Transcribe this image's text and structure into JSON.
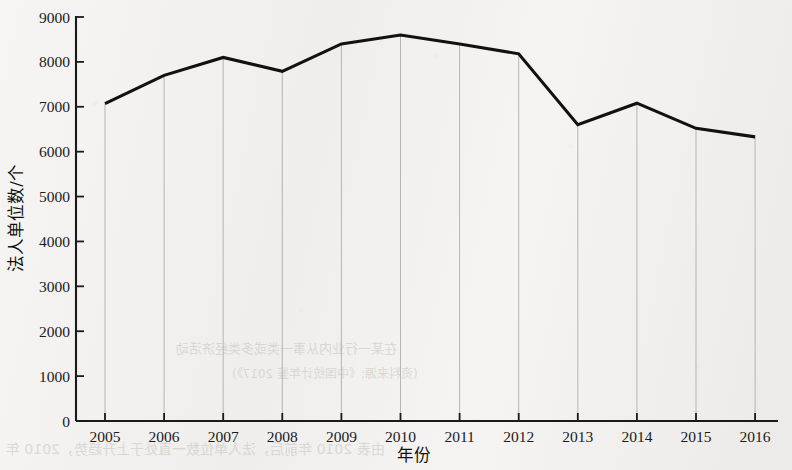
{
  "chart_data": {
    "type": "line",
    "title": "",
    "xlabel": "年份",
    "ylabel": "法人单位数/个",
    "categories": [
      "2005",
      "2006",
      "2007",
      "2008",
      "2009",
      "2010",
      "2011",
      "2012",
      "2013",
      "2014",
      "2015",
      "2016"
    ],
    "values": [
      7070,
      7700,
      8100,
      7790,
      8400,
      8600,
      8400,
      8180,
      6600,
      7080,
      6520,
      6330
    ],
    "series": [
      {
        "name": "法人单位数",
        "values": [
          7070,
          7700,
          8100,
          7790,
          8400,
          8600,
          8400,
          8180,
          6600,
          7080,
          6520,
          6330
        ]
      }
    ],
    "ylim": [
      0,
      9000
    ],
    "ytick_labels": [
      "0",
      "1000",
      "2000",
      "3000",
      "4000",
      "5000",
      "6000",
      "7000",
      "8000",
      "9000"
    ],
    "ytick_values": [
      0,
      1000,
      2000,
      3000,
      4000,
      5000,
      6000,
      7000,
      8000,
      9000
    ],
    "xtick_labels": [
      "2005",
      "2006",
      "2007",
      "2008",
      "2009",
      "2010",
      "2011",
      "2012",
      "2013",
      "2014",
      "2015",
      "2016"
    ],
    "grid": "vertical-only",
    "legend": "none",
    "line_color": "#111111",
    "grid_color": "#b5b5b5",
    "axis_color": "#1a1a1a",
    "background_color": "#f2f1ef"
  },
  "scan_artifacts": {
    "description": "faint mirrored bleed-through text from reverse page",
    "marks": [
      {
        "text": "在某一行业内从事一类或多类经济活动",
        "x": 176,
        "y": 346,
        "size": 13
      },
      {
        "text": "(资料来源:《中国统计年鉴 2017》)",
        "x": 232,
        "y": 372,
        "size": 12
      },
      {
        "text": "由表 2010 年前后，法人单位数一直处于上升趋势，2010 年",
        "x": 6,
        "y": 444,
        "size": 14
      }
    ]
  }
}
